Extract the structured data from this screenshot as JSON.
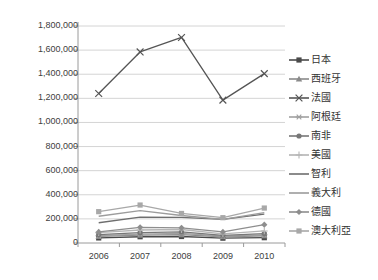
{
  "chart_data": {
    "type": "line",
    "title": "",
    "subtitle": "",
    "xlabel": "",
    "ylabel": "",
    "categories": [
      "2006",
      "2007",
      "2008",
      "2009",
      "2010"
    ],
    "x_tick_labels": [
      "2006",
      "2007",
      "2008",
      "2009",
      "2010"
    ],
    "y_tick_labels": [
      "0",
      "200,000",
      "400,000",
      "600,000",
      "800,000",
      "1,000,000",
      "1,200,000",
      "1,400,000",
      "1,600,000",
      "1,800,000"
    ],
    "y_tick_values": [
      0,
      200000,
      400000,
      600000,
      800000,
      1000000,
      1200000,
      1400000,
      1600000,
      1800000
    ],
    "ylim": [
      0,
      1800000
    ],
    "grid": "horizontal",
    "legend_position": "right",
    "series": [
      {
        "name": "日本",
        "marker": "square",
        "color": "#4a4a4a",
        "values": [
          42000,
          52000,
          54000,
          40000,
          44000
        ]
      },
      {
        "name": "西班牙",
        "marker": "triangle",
        "color": "#8a8a8a",
        "values": [
          55000,
          66000,
          70000,
          52000,
          60000
        ]
      },
      {
        "name": "法國",
        "marker": "x",
        "color": "#555555",
        "values": [
          1240000,
          1585000,
          1705000,
          1185000,
          1405000
        ]
      },
      {
        "name": "阿根廷",
        "marker": "asterisk",
        "color": "#a0a0a0",
        "values": [
          60000,
          74000,
          80000,
          56000,
          68000
        ]
      },
      {
        "name": "南非",
        "marker": "circle",
        "color": "#777777",
        "values": [
          70000,
          86000,
          92000,
          64000,
          78000
        ]
      },
      {
        "name": "美國",
        "marker": "plus",
        "color": "#b5b5b5",
        "values": [
          86000,
          108000,
          112000,
          76000,
          100000
        ]
      },
      {
        "name": "智利",
        "marker": "none",
        "color": "#6e6e6e",
        "values": [
          168000,
          215000,
          212000,
          196000,
          240000
        ]
      },
      {
        "name": "義大利",
        "marker": "none",
        "color": "#9c9c9c",
        "values": [
          222000,
          268000,
          228000,
          196000,
          252000
        ]
      },
      {
        "name": "德國",
        "marker": "diamond",
        "color": "#8e8e8e",
        "values": [
          92000,
          130000,
          126000,
          92000,
          152000
        ]
      },
      {
        "name": "澳大利亞",
        "marker": "square",
        "color": "#a8a8a8",
        "values": [
          260000,
          315000,
          245000,
          210000,
          290000
        ]
      }
    ]
  },
  "legend": {
    "items": [
      {
        "label": "日本"
      },
      {
        "label": "西班牙"
      },
      {
        "label": "法國"
      },
      {
        "label": "阿根廷"
      },
      {
        "label": "南非"
      },
      {
        "label": "美國"
      },
      {
        "label": "智利"
      },
      {
        "label": "義大利"
      },
      {
        "label": "德國"
      },
      {
        "label": "澳大利亞"
      }
    ]
  },
  "colors": {
    "axis": "#9a9a9a",
    "grid": "#d4d4d4",
    "tick_text": "#404040",
    "legend_text": "#333333",
    "background": "#ffffff"
  }
}
